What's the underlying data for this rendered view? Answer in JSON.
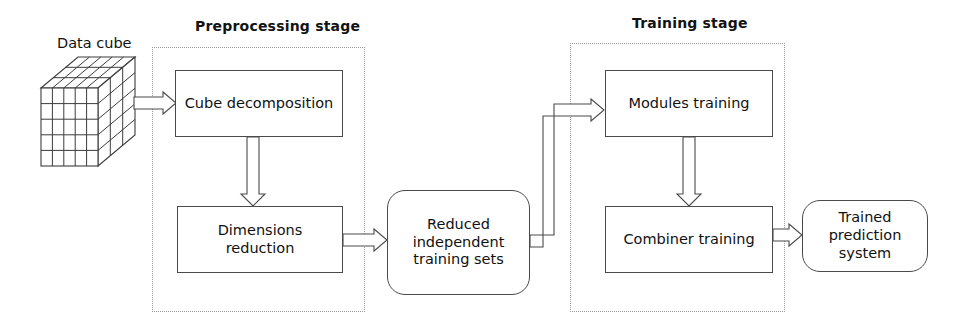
{
  "diagram": {
    "type": "flowchart",
    "background_color": "#ffffff",
    "line_color": "#4a4a4a",
    "dotted_container_color": "#9a9a9a"
  },
  "source": {
    "label": "Data cube",
    "shape": "3d-cube",
    "grid": {
      "columns": 5,
      "rows": 5,
      "depth": 3
    }
  },
  "stages": [
    {
      "id": "preprocessing",
      "label": "Preprocessing  stage",
      "nodes": [
        {
          "id": "cube-decomposition",
          "label": "Cube decomposition",
          "shape": "rectangle"
        },
        {
          "id": "dimensions-reduction",
          "label": "Dimensions reduction",
          "shape": "rectangle"
        }
      ]
    },
    {
      "id": "training",
      "label": "Training stage",
      "nodes": [
        {
          "id": "modules-training",
          "label": "Modules training",
          "shape": "rectangle"
        },
        {
          "id": "combiner-training",
          "label": "Combiner training",
          "shape": "rectangle"
        }
      ]
    }
  ],
  "intermediate": {
    "id": "reduced-independent-training-sets",
    "label": "Reduced\nindependent\ntraining sets",
    "shape": "rounded-rectangle"
  },
  "output": {
    "id": "trained-prediction-system",
    "label": "Trained\nprediction system",
    "shape": "rounded-rectangle"
  },
  "connectors": [
    {
      "id": "cube-to-decomposition",
      "from": "data-cube",
      "to": "cube-decomposition",
      "direction": "right",
      "style": "hollow-block-arrow"
    },
    {
      "id": "decomposition-to-reduction",
      "from": "cube-decomposition",
      "to": "dimensions-reduction",
      "direction": "down",
      "style": "hollow-block-arrow"
    },
    {
      "id": "reduction-to-sets",
      "from": "dimensions-reduction",
      "to": "reduced-independent-training-sets",
      "direction": "right",
      "style": "hollow-block-arrow"
    },
    {
      "id": "sets-to-modules",
      "from": "reduced-independent-training-sets",
      "to": "modules-training",
      "direction": "elbow-up-right",
      "style": "hollow-block-arrow"
    },
    {
      "id": "modules-to-combiner",
      "from": "modules-training",
      "to": "combiner-training",
      "direction": "down",
      "style": "hollow-block-arrow"
    },
    {
      "id": "combiner-to-output",
      "from": "combiner-training",
      "to": "trained-prediction-system",
      "direction": "right",
      "style": "hollow-block-arrow"
    }
  ]
}
